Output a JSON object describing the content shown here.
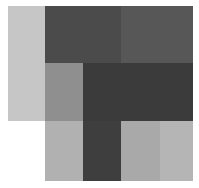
{
  "grid": {
    "cols": [
      8,
      45,
      83,
      121,
      160,
      193
    ],
    "rows": [
      6,
      63,
      121,
      181
    ],
    "cells": [
      {
        "r": 0,
        "c": 0,
        "rs": 2,
        "cs": 1,
        "color": "#c6c6c6"
      },
      {
        "r": 0,
        "c": 1,
        "rs": 1,
        "cs": 2,
        "color": "#4b4b4b"
      },
      {
        "r": 0,
        "c": 3,
        "rs": 1,
        "cs": 2,
        "color": "#575757"
      },
      {
        "r": 1,
        "c": 1,
        "rs": 1,
        "cs": 1,
        "color": "#8f8f8f"
      },
      {
        "r": 1,
        "c": 2,
        "rs": 1,
        "cs": 3,
        "color": "#3b3b3b"
      },
      {
        "r": 2,
        "c": 1,
        "rs": 1,
        "cs": 1,
        "color": "#b1b1b1"
      },
      {
        "r": 2,
        "c": 2,
        "rs": 1,
        "cs": 1,
        "color": "#3e3e3e"
      },
      {
        "r": 2,
        "c": 3,
        "rs": 1,
        "cs": 1,
        "color": "#a9a9a9"
      },
      {
        "r": 2,
        "c": 4,
        "rs": 1,
        "cs": 1,
        "color": "#b5b5b5"
      }
    ]
  }
}
